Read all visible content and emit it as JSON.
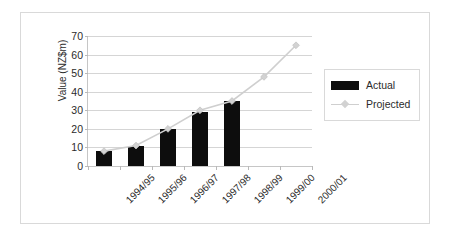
{
  "chart_data": {
    "type": "bar",
    "title": "",
    "xlabel": "",
    "ylabel": "Value (NZ$m)",
    "categories": [
      "1994/95",
      "1995/96",
      "1996/97",
      "1997/98",
      "1998/99",
      "1999/00",
      "2000/01"
    ],
    "ylim": [
      0,
      70
    ],
    "ytick_labels": [
      "0",
      "10",
      "20",
      "30",
      "40",
      "50",
      "60",
      "70"
    ],
    "ytick_values": [
      0,
      10,
      20,
      30,
      40,
      50,
      60,
      70
    ],
    "grid": true,
    "legend_position": "right",
    "series": [
      {
        "name": "Actual",
        "type": "bar",
        "color": "#0d0d0d",
        "values": [
          8,
          11,
          20,
          29,
          35,
          null,
          null
        ]
      },
      {
        "name": "Projected",
        "type": "line",
        "color": "#cfcfcf",
        "marker": "diamond",
        "values": [
          8,
          11,
          20,
          30,
          35,
          48,
          65
        ]
      }
    ]
  },
  "legend": {
    "items": [
      {
        "label": "Actual",
        "swatch": "bar"
      },
      {
        "label": "Projected",
        "swatch": "line"
      }
    ]
  }
}
